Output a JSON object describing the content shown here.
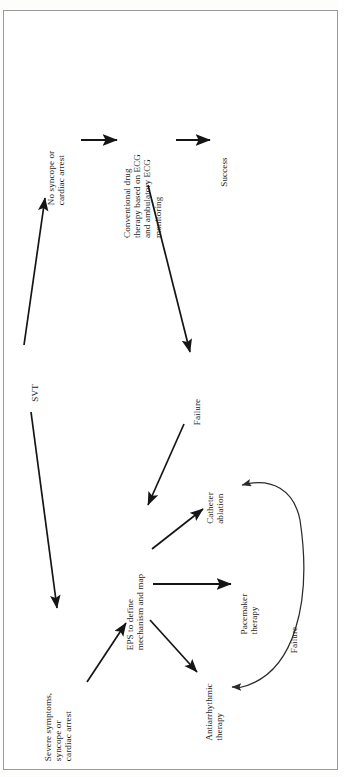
{
  "figure": {
    "orientation": "rotated-90-ccw",
    "type": "clinical-flowchart",
    "title_visible": false,
    "border_color": "#9a9a9a",
    "ink_color": "#1b1b1b",
    "background": "#ffffff"
  },
  "nodes": [
    {
      "id": "svt",
      "label_lines": [
        "SVT"
      ]
    },
    {
      "id": "no-syncope",
      "label_lines": [
        "No syncope or",
        "cardiac arrest"
      ]
    },
    {
      "id": "severe",
      "label_lines": [
        "Severe symptoms,",
        "syncope or",
        "cardiac arrest"
      ]
    },
    {
      "id": "conventional",
      "label_lines": [
        "Conventional drug",
        "therapy based on ECG",
        "and ambulatory ECG",
        "monitoring"
      ]
    },
    {
      "id": "success",
      "label_lines": [
        "Success"
      ]
    },
    {
      "id": "failure-top",
      "label_lines": [
        "Failure"
      ]
    },
    {
      "id": "eps",
      "label_lines": [
        "EPS to define",
        "mechanism and map"
      ]
    },
    {
      "id": "catheter",
      "label_lines": [
        "Catheter",
        "ablation"
      ]
    },
    {
      "id": "pacemaker",
      "label_lines": [
        "Pacemaker",
        "therapy"
      ]
    },
    {
      "id": "antiarrhythmic",
      "label_lines": [
        "Antiarrhythmic",
        "therapy"
      ]
    },
    {
      "id": "failure-curve",
      "label_lines": [
        "Failure"
      ]
    }
  ],
  "edges": [
    {
      "id": "svt-to-no-syncope",
      "from": "svt",
      "to": "no-syncope",
      "label": "SVT",
      "style": "straight-arrow"
    },
    {
      "id": "svt-to-severe",
      "from": "svt",
      "to": "severe",
      "label": "SVT",
      "style": "straight-arrow"
    },
    {
      "id": "no-syncope-to-conv",
      "from": "no-syncope",
      "to": "conventional",
      "label": "",
      "style": "straight-arrow"
    },
    {
      "id": "conv-to-success",
      "from": "conventional",
      "to": "success",
      "label": "",
      "style": "straight-arrow"
    },
    {
      "id": "conv-to-eps",
      "from": "conventional",
      "to": "eps",
      "label": "Failure",
      "style": "straight-arrow"
    },
    {
      "id": "severe-to-eps",
      "from": "severe",
      "to": "eps",
      "label": "",
      "style": "straight-arrow"
    },
    {
      "id": "eps-to-catheter",
      "from": "eps",
      "to": "catheter",
      "label": "",
      "style": "straight-arrow"
    },
    {
      "id": "eps-to-pacemaker",
      "from": "eps",
      "to": "pacemaker",
      "label": "",
      "style": "straight-arrow"
    },
    {
      "id": "eps-to-antiarrhythmic",
      "from": "eps",
      "to": "antiarrhythmic",
      "label": "",
      "style": "straight-arrow"
    },
    {
      "id": "antiarrhythmic-to-catheter",
      "from": "antiarrhythmic",
      "to": "catheter",
      "label": "Failure",
      "style": "curved-double-arrow"
    }
  ]
}
